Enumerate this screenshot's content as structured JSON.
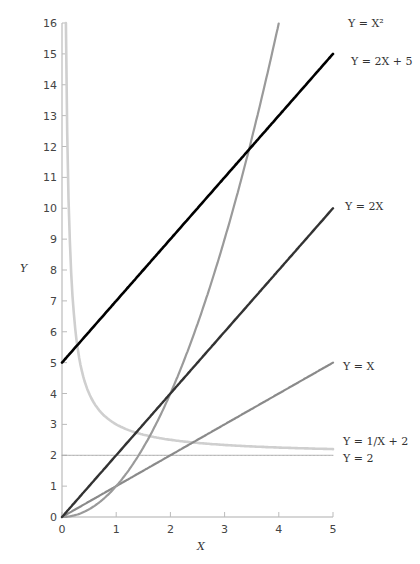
{
  "chart_data": {
    "type": "line",
    "title": "",
    "xlabel": "X",
    "ylabel": "Y",
    "xlim": [
      0,
      5
    ],
    "ylim": [
      0,
      16
    ],
    "x_ticks": [
      0,
      1,
      2,
      3,
      4,
      5
    ],
    "y_ticks": [
      0,
      1,
      2,
      3,
      4,
      5,
      6,
      7,
      8,
      9,
      10,
      11,
      12,
      13,
      14,
      15,
      16
    ],
    "grid": false,
    "legend_position": "inline-right",
    "series": [
      {
        "name": "Y = X²",
        "label": "Y = X²",
        "formula": "x^2",
        "color": "#9a9a9a",
        "width": 2.2,
        "x": [
          0,
          0.5,
          1,
          1.5,
          2,
          2.5,
          3,
          3.5,
          4,
          4.1
        ],
        "values": [
          0,
          0.25,
          1,
          2.25,
          4,
          6.25,
          9,
          12.25,
          16,
          16.81
        ],
        "label_y": 16.3
      },
      {
        "name": "Y = 2X + 5",
        "label": "Y = 2X + 5",
        "formula": "2x+5",
        "color": "#000000",
        "width": 2.6,
        "x": [
          0,
          5
        ],
        "values": [
          5,
          15
        ],
        "label_y": 15.2
      },
      {
        "name": "Y = 2X",
        "label": "Y = 2X",
        "formula": "2x",
        "color": "#333333",
        "width": 2.4,
        "x": [
          0,
          5
        ],
        "values": [
          0,
          10
        ],
        "label_y": 10.2
      },
      {
        "name": "Y = X",
        "label": "Y = X",
        "formula": "x",
        "color": "#8a8a8a",
        "width": 2.2,
        "x": [
          0,
          5
        ],
        "values": [
          0,
          5
        ],
        "label_y": 5.1
      },
      {
        "name": "Y = 1/X + 2",
        "label": "Y = 1/X + 2",
        "formula": "1/x+2",
        "color": "#cfcfcf",
        "width": 2.6,
        "x": [
          0.071,
          0.1,
          0.2,
          0.3,
          0.5,
          1,
          2,
          3,
          4,
          5
        ],
        "values": [
          16,
          12,
          7,
          5.33,
          4,
          3,
          2.5,
          2.33,
          2.25,
          2.2
        ],
        "label_y": 2.45
      },
      {
        "name": "Y = 2",
        "label": "Y = 2",
        "formula": "2",
        "color": "#a8a8a8",
        "width": 1,
        "x": [
          0,
          5
        ],
        "values": [
          2,
          2
        ],
        "label_y": 1.75
      }
    ]
  },
  "axes": {
    "x_title": "X",
    "y_title": "Y"
  }
}
